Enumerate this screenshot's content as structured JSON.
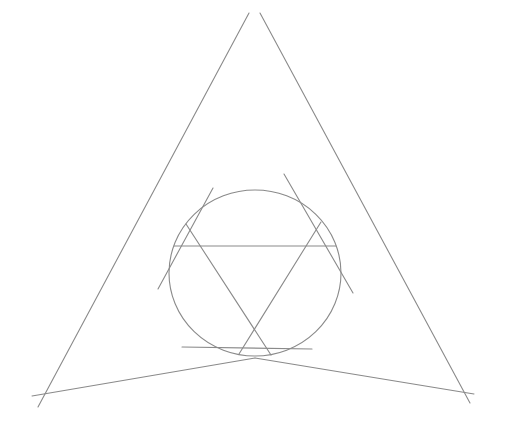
{
  "diagram": {
    "width": 513,
    "height": 433,
    "background": "#ffffff",
    "stroke_color": "#8a8a8a",
    "stroke_width": 1.1,
    "circle": {
      "cx": 255,
      "cy": 273,
      "rx": 86,
      "ry": 83
    },
    "outer_lines": [
      {
        "id": "left-side",
        "x1": 249,
        "y1": 13,
        "x2": 38,
        "y2": 407
      },
      {
        "id": "right-side",
        "x1": 260,
        "y1": 13,
        "x2": 470,
        "y2": 403
      },
      {
        "id": "base-left",
        "x1": 32,
        "y1": 396,
        "x2": 255,
        "y2": 358
      },
      {
        "id": "base-right",
        "x1": 255,
        "y1": 358,
        "x2": 474,
        "y2": 394
      }
    ],
    "tangent_segments": [
      {
        "id": "tangent-upper-left",
        "x1": 213,
        "y1": 188,
        "x2": 158,
        "y2": 289
      },
      {
        "id": "tangent-upper-right",
        "x1": 284,
        "y1": 174,
        "x2": 353,
        "y2": 293
      },
      {
        "id": "tangent-bottom",
        "x1": 182,
        "y1": 347,
        "x2": 312,
        "y2": 349
      }
    ],
    "inner_lines": [
      {
        "id": "chord-horizontal",
        "x1": 174,
        "y1": 246,
        "x2": 336,
        "y2": 246
      },
      {
        "id": "chord-left-diag",
        "x1": 186,
        "y1": 224,
        "x2": 271,
        "y2": 355
      },
      {
        "id": "chord-right-diag",
        "x1": 321,
        "y1": 222,
        "x2": 239,
        "y2": 354
      }
    ]
  }
}
